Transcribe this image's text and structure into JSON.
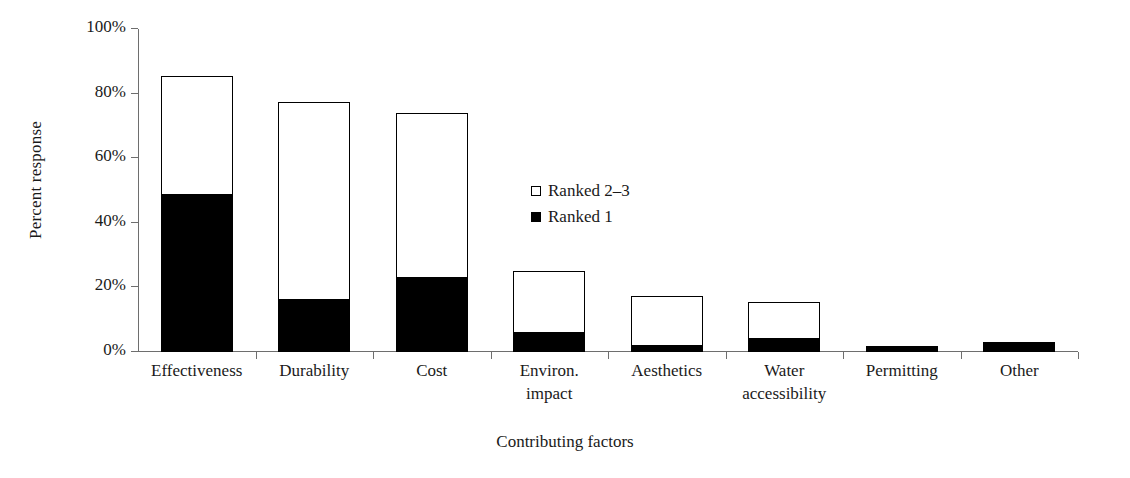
{
  "chart_data": {
    "type": "bar",
    "stacked": true,
    "title": "",
    "xlabel": "Contributing factors",
    "ylabel": "Percent response",
    "ylim": [
      0,
      100
    ],
    "yticks": [
      0,
      20,
      40,
      60,
      80,
      100
    ],
    "ytick_labels": [
      "0%",
      "20%",
      "40%",
      "60%",
      "80%",
      "100%"
    ],
    "grid": false,
    "legend_position": "center",
    "categories": [
      "Effectiveness",
      "Durability",
      "Cost",
      "Environ.\nimpact",
      "Aesthetics",
      "Water\naccessibility",
      "Permitting",
      "Other"
    ],
    "series": [
      {
        "name": "Ranked 1",
        "color": "#000000",
        "values": [
          48.5,
          16.0,
          23.0,
          6.0,
          2.0,
          4.0,
          2.0,
          3.0
        ]
      },
      {
        "name": "Ranked 2-3",
        "color": "#ffffff",
        "values": [
          36.5,
          61.0,
          50.5,
          18.5,
          15.0,
          11.0,
          0.0,
          0.0
        ]
      }
    ],
    "totals": [
      85.0,
      77.0,
      73.5,
      24.5,
      17.0,
      15.0,
      2.0,
      3.0
    ]
  },
  "legend": {
    "items": [
      {
        "label": "Ranked 2–3",
        "swatch": "hollow-square-icon"
      },
      {
        "label": "Ranked 1",
        "swatch": "filled-square-icon"
      }
    ]
  },
  "axes": {
    "y_title": "Percent response",
    "x_title": "Contributing factors"
  }
}
